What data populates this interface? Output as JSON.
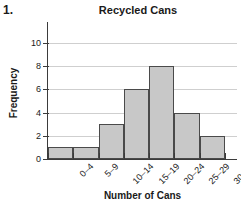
{
  "problem": {
    "number": "1."
  },
  "chart_data": {
    "type": "bar",
    "title": "Recycled Cans",
    "xlabel": "Number of Cans",
    "ylabel": "Frequency",
    "categories": [
      "0–4",
      "5–9",
      "10–14",
      "15–19",
      "20–24",
      "25–29",
      "30–34"
    ],
    "values": [
      1,
      1,
      3,
      6,
      8,
      4,
      2
    ],
    "ylim": [
      0,
      11
    ],
    "yticks": [
      0,
      2,
      4,
      6,
      8,
      10
    ],
    "ytick_labels": [
      "0",
      "2",
      "4",
      "6",
      "8",
      "10"
    ],
    "grid": true,
    "legend": false,
    "bar_fill_color": "#c8c8c8",
    "bar_edge_color": "#4a4a4a",
    "gridline_color": "#cfcfcf",
    "axis_color": "#3b3b3b"
  }
}
